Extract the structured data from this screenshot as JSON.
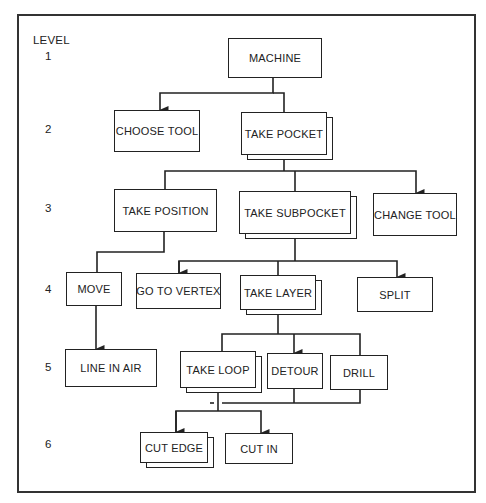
{
  "diagram": {
    "type": "hierarchy-chart",
    "level_header": "LEVEL",
    "levels": [
      "1",
      "2",
      "3",
      "4",
      "5",
      "6"
    ],
    "nodes": [
      {
        "id": "machine",
        "label": "MACHINE",
        "level": 1,
        "multiple": false
      },
      {
        "id": "choose_tool",
        "label": "CHOOSE TOOL",
        "level": 2,
        "multiple": false
      },
      {
        "id": "take_pocket",
        "label": "TAKE POCKET",
        "level": 2,
        "multiple": true
      },
      {
        "id": "take_position",
        "label": "TAKE POSITION",
        "level": 3,
        "multiple": false
      },
      {
        "id": "take_subpocket",
        "label": "TAKE SUBPOCKET",
        "level": 3,
        "multiple": true
      },
      {
        "id": "change_tool",
        "label": "CHANGE TOOL",
        "level": 3,
        "multiple": false
      },
      {
        "id": "move",
        "label": "MOVE",
        "level": 4,
        "multiple": false
      },
      {
        "id": "go_to_vertex",
        "label": "GO TO VERTEX",
        "level": 4,
        "multiple": false
      },
      {
        "id": "take_layer",
        "label": "TAKE LAYER",
        "level": 4,
        "multiple": true
      },
      {
        "id": "split",
        "label": "SPLIT",
        "level": 4,
        "multiple": false
      },
      {
        "id": "line_in_air",
        "label": "LINE IN AIR",
        "level": 5,
        "multiple": false
      },
      {
        "id": "take_loop",
        "label": "TAKE LOOP",
        "level": 5,
        "multiple": true
      },
      {
        "id": "detour",
        "label": "DETOUR",
        "level": 5,
        "multiple": false
      },
      {
        "id": "drill",
        "label": "DRILL",
        "level": 5,
        "multiple": false
      },
      {
        "id": "cut_edge",
        "label": "CUT EDGE",
        "level": 6,
        "multiple": true
      },
      {
        "id": "cut_in",
        "label": "CUT IN",
        "level": 6,
        "multiple": false
      }
    ],
    "edges": [
      {
        "from": "machine",
        "to": "choose_tool"
      },
      {
        "from": "machine",
        "to": "take_pocket"
      },
      {
        "from": "take_pocket",
        "to": "take_position"
      },
      {
        "from": "take_pocket",
        "to": "take_subpocket"
      },
      {
        "from": "take_pocket",
        "to": "change_tool"
      },
      {
        "from": "take_position",
        "to": "move"
      },
      {
        "from": "take_subpocket",
        "to": "go_to_vertex"
      },
      {
        "from": "take_subpocket",
        "to": "take_layer"
      },
      {
        "from": "take_subpocket",
        "to": "split"
      },
      {
        "from": "move",
        "to": "line_in_air"
      },
      {
        "from": "take_layer",
        "to": "take_loop"
      },
      {
        "from": "take_layer",
        "to": "detour"
      },
      {
        "from": "take_layer",
        "to": "drill"
      },
      {
        "from": "take_loop",
        "to": "cut_edge"
      },
      {
        "from": "take_loop",
        "to": "cut_in"
      }
    ]
  }
}
